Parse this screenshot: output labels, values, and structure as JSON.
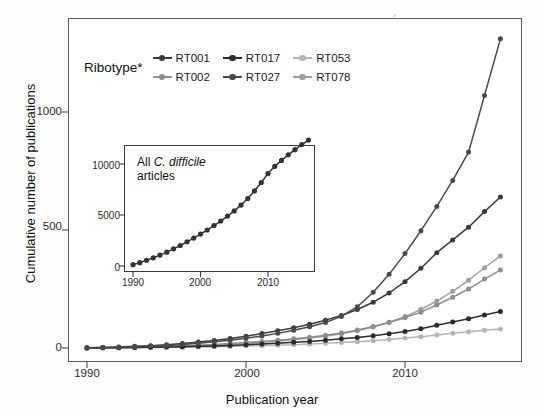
{
  "figure": {
    "background": "#fefefe"
  },
  "main": {
    "xlabel": "Publication year",
    "ylabel": "Cumulative number of publications",
    "xticks": [
      "1990",
      "2000",
      "2010"
    ],
    "yticks": [
      "0",
      "500",
      "1000"
    ]
  },
  "legend": {
    "title": "Ribotype*",
    "entries": [
      {
        "label": "RT001",
        "color": "#3a3a3a"
      },
      {
        "label": "RT017",
        "color": "#2b2b2b"
      },
      {
        "label": "RT053",
        "color": "#b5b5b5"
      },
      {
        "label": "RT002",
        "color": "#8e8e8e"
      },
      {
        "label": "RT027",
        "color": "#4a4a4a"
      },
      {
        "label": "RT078",
        "color": "#9e9e9e"
      }
    ]
  },
  "inset": {
    "title_line1_prefix": "All ",
    "title_species": "C. difficile",
    "title_line2": "articles",
    "xticks": [
      "1990",
      "2000",
      "2010"
    ],
    "yticks": [
      "0",
      "5000",
      "10000"
    ]
  },
  "chart_data": {
    "type": "line",
    "title": "",
    "xlabel": "Publication year",
    "ylabel": "Cumulative number of publications",
    "xlim": [
      1989.2,
      2016.6
    ],
    "ylim": [
      -28,
      1400
    ],
    "grid": false,
    "legend_position": "top-left",
    "x": [
      1990,
      1991,
      1992,
      1993,
      1994,
      1995,
      1996,
      1997,
      1998,
      1999,
      2000,
      2001,
      2002,
      2003,
      2004,
      2005,
      2006,
      2007,
      2008,
      2009,
      2010,
      2011,
      2012,
      2013,
      2014,
      2015,
      2016
    ],
    "series": [
      {
        "name": "RT001",
        "color": "#3a3a3a",
        "values": [
          1,
          2,
          4,
          7,
          10,
          14,
          19,
          25,
          32,
          40,
          50,
          61,
          73,
          86,
          101,
          118,
          138,
          163,
          194,
          233,
          281,
          338,
          404,
          458,
          512,
          578,
          640
        ]
      },
      {
        "name": "RT017",
        "color": "#2b2b2b",
        "values": [
          0,
          1,
          1,
          2,
          3,
          4,
          5,
          7,
          9,
          11,
          14,
          17,
          20,
          24,
          28,
          33,
          39,
          45,
          52,
          60,
          70,
          82,
          96,
          110,
          124,
          140,
          155
        ]
      },
      {
        "name": "RT053",
        "color": "#b5b5b5",
        "values": [
          0,
          0,
          1,
          1,
          2,
          2,
          3,
          4,
          5,
          6,
          8,
          10,
          12,
          14,
          17,
          20,
          23,
          27,
          31,
          36,
          42,
          48,
          55,
          62,
          69,
          75,
          80
        ]
      },
      {
        "name": "RT002",
        "color": "#8e8e8e",
        "values": [
          0,
          1,
          2,
          3,
          5,
          7,
          9,
          12,
          15,
          19,
          23,
          28,
          33,
          39,
          46,
          54,
          64,
          76,
          91,
          108,
          128,
          152,
          182,
          215,
          250,
          292,
          330
        ]
      },
      {
        "name": "RT027",
        "color": "#4a4a4a",
        "values": [
          1,
          2,
          3,
          5,
          8,
          11,
          15,
          20,
          26,
          33,
          41,
          51,
          62,
          75,
          90,
          108,
          134,
          175,
          236,
          312,
          400,
          497,
          600,
          710,
          830,
          1070,
          1310
        ]
      },
      {
        "name": "RT078",
        "color": "#9e9e9e",
        "values": [
          0,
          1,
          2,
          3,
          4,
          6,
          8,
          10,
          13,
          16,
          20,
          24,
          29,
          35,
          42,
          50,
          60,
          73,
          89,
          109,
          133,
          163,
          199,
          240,
          287,
          340,
          390
        ]
      }
    ]
  },
  "inset_chart_data": {
    "type": "line",
    "title": "All C. difficile articles",
    "xlim": [
      1989.2,
      2016.4
    ],
    "ylim": [
      -420,
      12900
    ],
    "grid": false,
    "color": "#333333",
    "x": [
      1990,
      1991,
      1992,
      1993,
      1994,
      1995,
      1996,
      1997,
      1998,
      1999,
      2000,
      2001,
      2002,
      2003,
      2004,
      2005,
      2006,
      2007,
      2008,
      2009,
      2010,
      2011,
      2012,
      2013,
      2014,
      2015,
      2016
    ],
    "values": [
      130,
      330,
      560,
      800,
      1070,
      1360,
      1680,
      2010,
      2370,
      2740,
      3130,
      3530,
      3960,
      4410,
      4890,
      5400,
      5970,
      6620,
      7360,
      8180,
      9060,
      9770,
      10350,
      10900,
      11400,
      11900,
      12350
    ]
  }
}
